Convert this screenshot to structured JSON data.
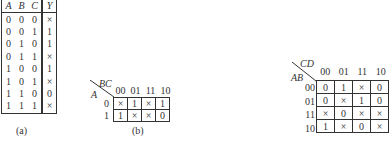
{
  "truth_table": {
    "headers": [
      "A",
      "B",
      "C",
      "Y"
    ],
    "rows": [
      [
        "0",
        "0",
        "0",
        "×"
      ],
      [
        "0",
        "0",
        "1",
        "1"
      ],
      [
        "0",
        "1",
        "0",
        "1"
      ],
      [
        "0",
        "1",
        "1",
        "×"
      ],
      [
        "1",
        "0",
        "0",
        "1"
      ],
      [
        "1",
        "0",
        "1",
        "×"
      ],
      [
        "1",
        "1",
        "0",
        "0"
      ],
      [
        "1",
        "1",
        "1",
        "×"
      ]
    ],
    "caption": "(a)"
  },
  "kmap3": {
    "row_var": "A",
    "col_var": "BC",
    "col_labels": [
      "00",
      "01",
      "11",
      "10"
    ],
    "row_labels": [
      "0",
      "1"
    ],
    "cells": [
      [
        "×",
        "1",
        "×",
        "1"
      ],
      [
        "1",
        "×",
        "×",
        "0"
      ]
    ],
    "caption": "(b)"
  },
  "kmap4": {
    "row_var": "AB",
    "col_var": "CD",
    "col_labels": [
      "00",
      "01",
      "11",
      "10"
    ],
    "row_labels": [
      "00",
      "01",
      "11",
      "10"
    ],
    "cells": [
      [
        "0",
        "1",
        "×",
        "0"
      ],
      [
        "0",
        "×",
        "1",
        "0"
      ],
      [
        "×",
        "0",
        "×",
        "×"
      ],
      [
        "1",
        "×",
        "0",
        "×"
      ]
    ]
  }
}
